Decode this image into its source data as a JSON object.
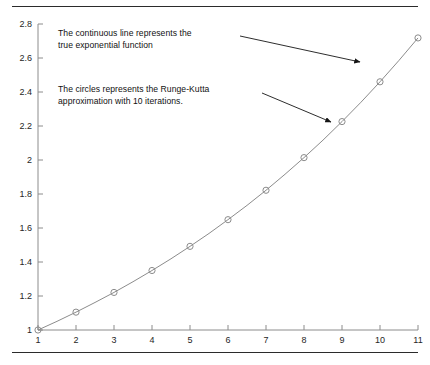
{
  "figure": {
    "rule_top_label": "top-rule",
    "rule_bottom_label": "bottom-rule"
  },
  "annotations": {
    "line_text": "The continuous line represents the\ntrue exponential function",
    "circles_text": "The circles represents the Runge-Kutta\napproximation with 10 iterations."
  },
  "chart_data": {
    "type": "line",
    "title": "",
    "xlabel": "",
    "ylabel": "",
    "xlim": [
      1,
      11
    ],
    "ylim": [
      1,
      2.8
    ],
    "grid": false,
    "legend": "none",
    "xticks": [
      "1",
      "2",
      "3",
      "4",
      "5",
      "6",
      "7",
      "8",
      "9",
      "10",
      "11"
    ],
    "yticks": [
      "1",
      "1.2",
      "1.4",
      "1.6",
      "1.8",
      "2",
      "2.2",
      "2.4",
      "2.6",
      "2.8"
    ],
    "series": [
      {
        "name": "true exponential function",
        "style": "continuous-line",
        "color": "#8c8c8c",
        "x": [
          1,
          1.5,
          2,
          2.5,
          3,
          3.5,
          4,
          4.5,
          5,
          5.5,
          6,
          6.5,
          7,
          7.5,
          8,
          8.5,
          9,
          9.5,
          10,
          10.5,
          11
        ],
        "y": [
          1,
          1.051,
          1.105,
          1.162,
          1.221,
          1.284,
          1.35,
          1.419,
          1.492,
          1.568,
          1.649,
          1.733,
          1.822,
          1.916,
          2.014,
          2.117,
          2.226,
          2.34,
          2.46,
          2.586,
          2.718
        ]
      },
      {
        "name": "Runge-Kutta approximation with 10 iterations",
        "style": "open-circle-markers",
        "color": "#8c8c8c",
        "x": [
          1,
          2,
          3,
          4,
          5,
          6,
          7,
          8,
          9,
          10,
          11
        ],
        "y": [
          1,
          1.105,
          1.221,
          1.35,
          1.492,
          1.649,
          1.822,
          2.014,
          2.226,
          2.46,
          2.718
        ]
      }
    ],
    "annotation_arrows": [
      {
        "name": "arrow-to-line",
        "from": [
          240,
          36
        ],
        "to": [
          360,
          62
        ],
        "target": "continuous line"
      },
      {
        "name": "arrow-to-circle",
        "from": [
          262,
          93
        ],
        "to": [
          331,
          122
        ],
        "target": "circle marker"
      }
    ]
  },
  "colors": {
    "curve": "#8c8c8c",
    "marker_stroke": "#8c8c8c",
    "axis": "#8c8c8c",
    "arrow": "#151515",
    "text": "#111111",
    "rule": "#2b2b2b"
  }
}
